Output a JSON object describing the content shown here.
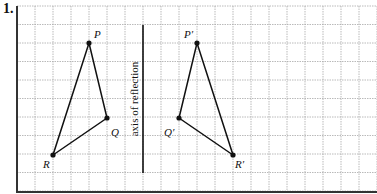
{
  "exercise": {
    "number": "1.",
    "axis_label": "axis of reflection"
  },
  "colors": {
    "grid": "#a8a8a8",
    "border": "#333333",
    "ink": "#111111"
  },
  "grid": {
    "x0": 17,
    "y0": 6,
    "dx": 18,
    "dy": 18.5,
    "cols": 20,
    "rows": 10,
    "right": 377,
    "bottom": 192
  },
  "axis": {
    "x": 143,
    "y1": 25,
    "y2": 173
  },
  "original_triangle": {
    "points": [
      {
        "label": "P",
        "x": 89,
        "y": 43,
        "lx": 94,
        "ly": 38
      },
      {
        "label": "Q",
        "x": 107,
        "y": 118,
        "lx": 111,
        "ly": 136
      },
      {
        "label": "R",
        "x": 53,
        "y": 155,
        "lx": 43,
        "ly": 168
      }
    ]
  },
  "reflected_triangle": {
    "points": [
      {
        "label": "P′",
        "x": 197,
        "y": 43,
        "lx": 184,
        "ly": 38
      },
      {
        "label": "Q′",
        "x": 179,
        "y": 118,
        "lx": 164,
        "ly": 136
      },
      {
        "label": "R′",
        "x": 233,
        "y": 155,
        "lx": 235,
        "ly": 168
      }
    ]
  }
}
